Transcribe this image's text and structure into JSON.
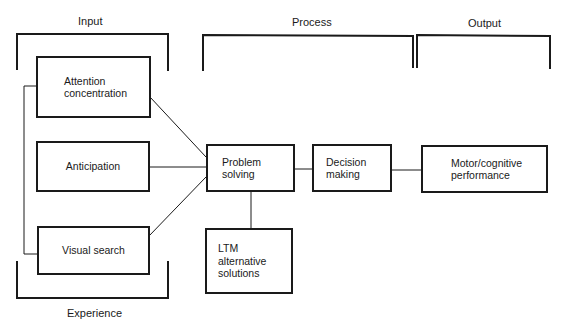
{
  "sections": {
    "input": "Input",
    "process": "Process",
    "output": "Output",
    "experience": "Experience"
  },
  "boxes": {
    "attention": {
      "line1": "Attention",
      "line2": "concentration"
    },
    "anticipation": {
      "line1": "Anticipation"
    },
    "visual_search": {
      "line1": "Visual search"
    },
    "problem_solving": {
      "line1": "Problem",
      "line2": "solving"
    },
    "decision_making": {
      "line1": "Decision",
      "line2": "making"
    },
    "motor_cognitive": {
      "line1": "Motor/cognitive",
      "line2": "performance"
    },
    "ltm": {
      "line1": "LTM",
      "line2": "alternative",
      "line3": "solutions"
    }
  },
  "colors": {
    "stroke": "#1a1a1a",
    "background": "#ffffff"
  }
}
